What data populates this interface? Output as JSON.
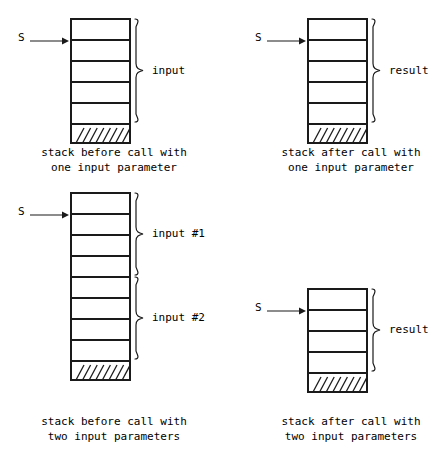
{
  "diagram": {
    "pointer_label": "S",
    "hatch_glyphs": "////////",
    "figures": [
      {
        "id": "before-one-input",
        "pointer": "S",
        "cells": 5,
        "groups": [
          {
            "label": "input",
            "from_cell": 0,
            "to_cell": 4
          }
        ],
        "caption_line1": "stack before call with",
        "caption_line2": "one input parameter"
      },
      {
        "id": "after-one-input",
        "pointer": "S",
        "cells": 5,
        "groups": [
          {
            "label": "result",
            "from_cell": 0,
            "to_cell": 4
          }
        ],
        "caption_line1": "stack after call with",
        "caption_line2": "one input parameter"
      },
      {
        "id": "before-two-inputs",
        "pointer": "S",
        "cells": 8,
        "groups": [
          {
            "label": "input #1",
            "from_cell": 0,
            "to_cell": 3
          },
          {
            "label": "input #2",
            "from_cell": 4,
            "to_cell": 7
          }
        ],
        "caption_line1": "stack before call with",
        "caption_line2": "two input parameters"
      },
      {
        "id": "after-two-inputs",
        "pointer": "S",
        "cells": 4,
        "groups": [
          {
            "label": "result",
            "from_cell": 0,
            "to_cell": 3
          }
        ],
        "caption_line1": "stack after call with",
        "caption_line2": "two input parameters"
      }
    ]
  },
  "colors": {
    "ink": "#1a1a1a",
    "background": "#ffffff"
  }
}
